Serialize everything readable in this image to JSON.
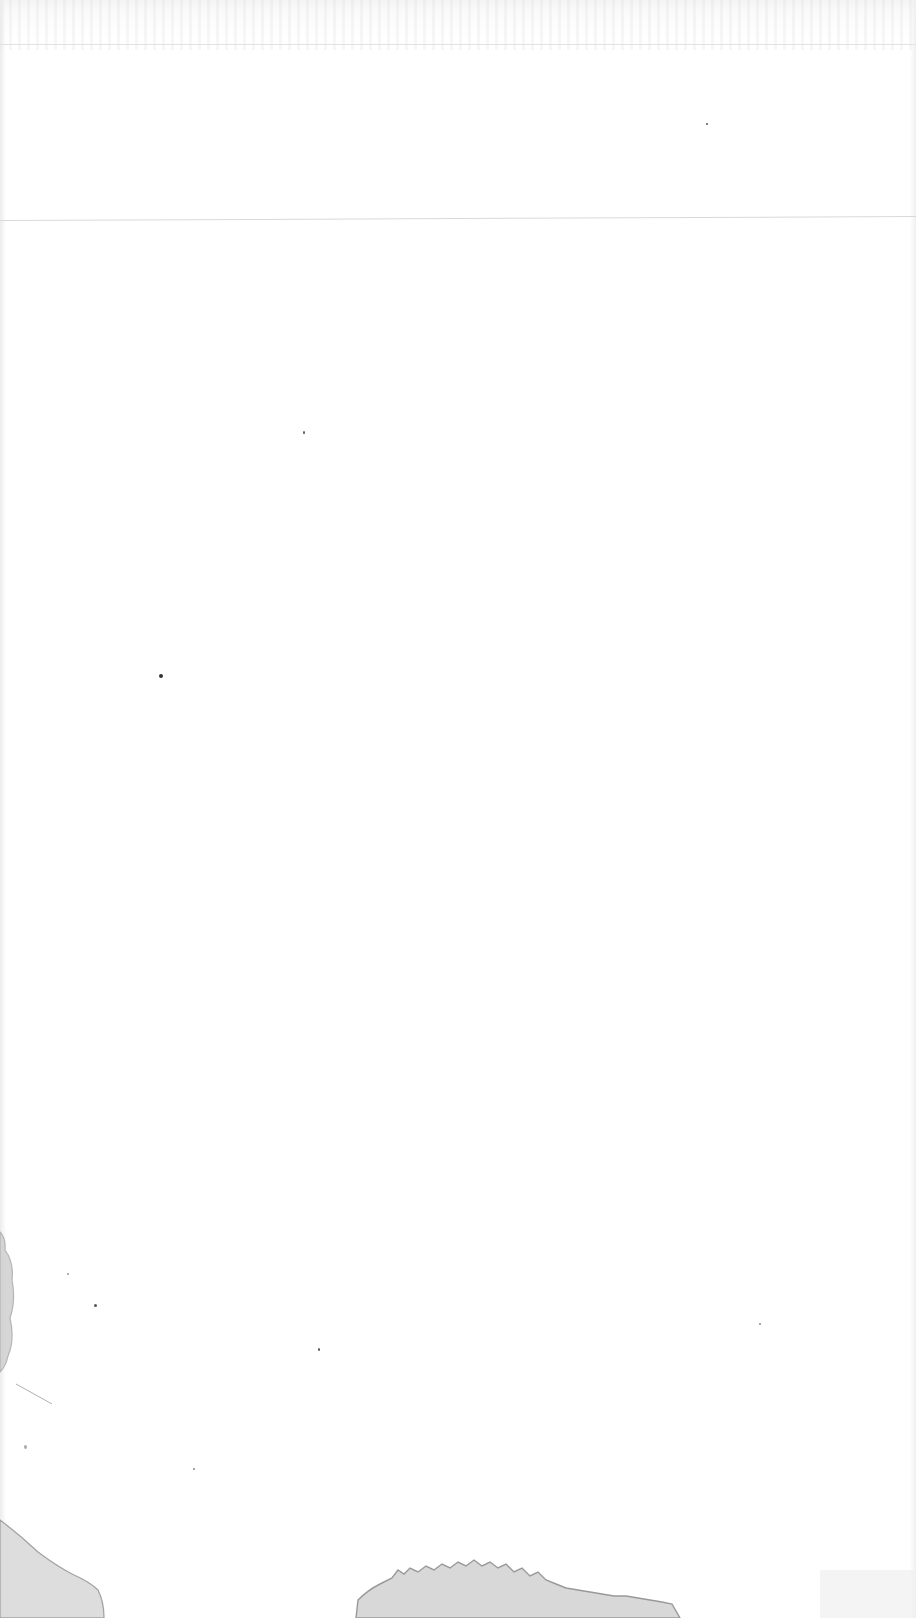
{
  "document": {
    "type": "scanned-page",
    "text_content": [],
    "description": "Blank scanned paper page with faint ruled lines near the top, dust specks, and water-stain marks at the lower left and bottom edge"
  },
  "colors": {
    "paper": "#ffffff",
    "rule_line": "#d9d9d9",
    "stain": "#9a9a9a",
    "speck": "#555555"
  }
}
